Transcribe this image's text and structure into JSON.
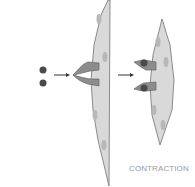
{
  "labels": {
    "contraction": "CONTRACTION"
  },
  "colors": {
    "cell_fill": "#d9d9d9",
    "cell_stroke": "#8a8a8a",
    "nucleus": "#b8b8b8",
    "receptor": "#8c8c8c",
    "ligand": "#4a4a4a",
    "arrow": "#333333"
  }
}
